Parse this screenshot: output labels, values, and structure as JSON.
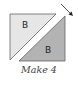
{
  "diagram": {
    "type": "half-square-triangle quilt block",
    "top_left_triangle": {
      "label": "B",
      "fill": "#e6e6e6",
      "stroke": "#555555"
    },
    "bottom_right_triangle": {
      "label": "B",
      "fill": "#b3b3b3",
      "stroke": "#555555"
    },
    "arrow": {
      "icon": "arrow-down-right-icon",
      "color": "#222222"
    },
    "caption": "Make 4"
  }
}
